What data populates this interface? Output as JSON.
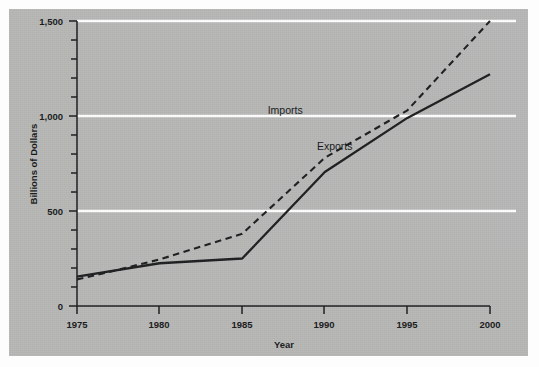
{
  "chart_data": {
    "type": "line",
    "title": "",
    "xlabel": "Year",
    "ylabel": "Billions of Dollars",
    "xlim": [
      1975,
      2000
    ],
    "ylim": [
      0,
      1500
    ],
    "grid": "horizontal-major",
    "legend_position": "inline-annotation",
    "x": [
      1975,
      1980,
      1985,
      1990,
      1995,
      2000
    ],
    "xticklabels": [
      "1975",
      "1980",
      "1985",
      "1990",
      "1995",
      "2000"
    ],
    "yticks": [
      0,
      500,
      1000,
      1500
    ],
    "yticklabels": [
      "0",
      "500",
      "1,000",
      "1,500"
    ],
    "yminorticks": [
      100,
      200,
      300,
      400,
      600,
      700,
      800,
      900,
      1100,
      1200,
      1300,
      1400
    ],
    "series": [
      {
        "name": "Imports",
        "style": "dashed",
        "color": "#1c1d1f",
        "values": [
          140,
          245,
          380,
          780,
          1030,
          1500
        ],
        "points": [
          {
            "x": 1975,
            "y": 140
          },
          {
            "x": 1977,
            "y": 180
          },
          {
            "x": 1980,
            "y": 245
          },
          {
            "x": 1985,
            "y": 380
          },
          {
            "x": 1990,
            "y": 780
          },
          {
            "x": 1995,
            "y": 1030
          },
          {
            "x": 2000,
            "y": 1500
          }
        ]
      },
      {
        "name": "Exports",
        "style": "solid",
        "color": "#1c1d1f",
        "values": [
          155,
          225,
          250,
          705,
          990,
          1220
        ],
        "points": [
          {
            "x": 1975,
            "y": 155
          },
          {
            "x": 1980,
            "y": 225
          },
          {
            "x": 1985,
            "y": 250
          },
          {
            "x": 1990,
            "y": 705
          },
          {
            "x": 1995,
            "y": 990
          },
          {
            "x": 2000,
            "y": 1220
          }
        ]
      }
    ],
    "annotations": [
      {
        "text": "Imports",
        "x": 1987.6,
        "y": 1010
      },
      {
        "text": "Exports",
        "x": 1990.6,
        "y": 820
      }
    ]
  },
  "colors": {
    "plate_background": "#b7b8b6",
    "page_background": "#fdfdfd",
    "gridline": "#ffffff",
    "axis": "#1c1d1f",
    "text": "#17181a"
  }
}
